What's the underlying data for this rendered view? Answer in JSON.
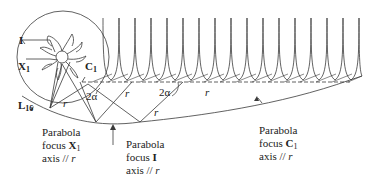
{
  "diagram": {
    "colors": {
      "stroke": "#3a3a3a",
      "text": "#222222",
      "background": "#ffffff"
    },
    "points": {
      "I": {
        "label": "I"
      },
      "X1": {
        "label": "X",
        "sub": "1"
      },
      "C1": {
        "label": "C",
        "sub": "1"
      },
      "L16": {
        "label": "L",
        "sub": "16"
      }
    },
    "angle_labels": [
      "2α",
      "2α"
    ],
    "segment_labels": [
      "r",
      "r",
      "r",
      "r"
    ],
    "annotations": [
      {
        "line1": "Parabola",
        "line2_prefix": "focus ",
        "line2_bold": "X",
        "line2_sub": "1",
        "line3_prefix": "axis // ",
        "line3_italic": "r"
      },
      {
        "line1": "Parabola",
        "line2_prefix": "focus ",
        "line2_bold": "I",
        "line2_sub": "",
        "line3_prefix": "axis // ",
        "line3_italic": "r"
      },
      {
        "line1": "Parabola",
        "line2_prefix": "focus ",
        "line2_bold": "C",
        "line2_sub": "1",
        "line3_prefix": "axis // ",
        "line3_italic": "r"
      }
    ],
    "cusp_count": 17
  }
}
